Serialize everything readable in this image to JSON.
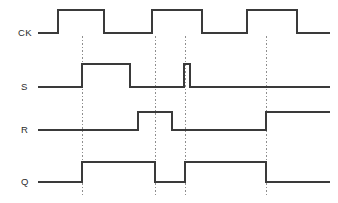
{
  "diagram": {
    "type": "digital-timing-waveform",
    "width": 338,
    "height": 203,
    "background_color": "#ffffff",
    "wave_color": "#3a3a3a",
    "marker_color": "#8e8e8e",
    "label_color": "#2b2b2b"
  },
  "signals": [
    {
      "name": "CK",
      "label": "CK",
      "label_x": 18,
      "label_y": 36,
      "low_y": 33,
      "high_y": 10,
      "start_x": 38,
      "end_x": 330,
      "initial_level": "low",
      "transitions": [
        {
          "x": 58,
          "to": "high"
        },
        {
          "x": 104,
          "to": "low"
        },
        {
          "x": 152,
          "to": "high"
        },
        {
          "x": 202,
          "to": "low"
        },
        {
          "x": 247,
          "to": "high"
        },
        {
          "x": 297,
          "to": "low"
        }
      ]
    },
    {
      "name": "S",
      "label": "S",
      "label_x": 21,
      "label_y": 90,
      "low_y": 87,
      "high_y": 64,
      "start_x": 38,
      "end_x": 330,
      "initial_level": "low",
      "transitions": [
        {
          "x": 82,
          "to": "high"
        },
        {
          "x": 130,
          "to": "low"
        },
        {
          "x": 184,
          "to": "high"
        },
        {
          "x": 190,
          "to": "low"
        }
      ]
    },
    {
      "name": "R",
      "label": "R",
      "label_x": 21,
      "label_y": 133,
      "low_y": 130,
      "high_y": 112,
      "start_x": 38,
      "end_x": 330,
      "initial_level": "low",
      "transitions": [
        {
          "x": 138,
          "to": "high"
        },
        {
          "x": 172,
          "to": "low"
        },
        {
          "x": 266,
          "to": "high"
        }
      ]
    },
    {
      "name": "Q",
      "label": "Q",
      "label_x": 21,
      "label_y": 185,
      "low_y": 182,
      "high_y": 162,
      "start_x": 38,
      "end_x": 330,
      "initial_level": "low",
      "transitions": [
        {
          "x": 82,
          "to": "high"
        },
        {
          "x": 155,
          "to": "low"
        },
        {
          "x": 185,
          "to": "high"
        },
        {
          "x": 266,
          "to": "low"
        }
      ]
    }
  ],
  "markers": [
    {
      "name": "marker-1",
      "x": 82,
      "y_top": 36,
      "y_bottom": 196
    },
    {
      "name": "marker-2",
      "x": 155,
      "y_top": 36,
      "y_bottom": 196
    },
    {
      "name": "marker-3",
      "x": 185,
      "y_top": 36,
      "y_bottom": 196
    },
    {
      "name": "marker-4",
      "x": 266,
      "y_top": 36,
      "y_bottom": 196
    }
  ]
}
